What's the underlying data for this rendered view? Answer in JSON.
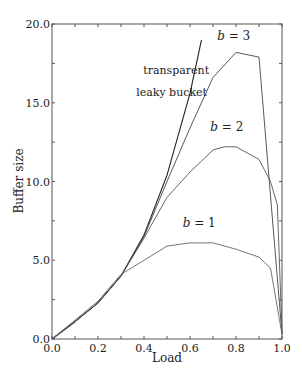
{
  "chart_data": {
    "type": "line",
    "title": "",
    "xlabel": "Load",
    "ylabel": "Buffer size",
    "xlim": [
      0.0,
      1.0
    ],
    "ylim": [
      0.0,
      20.0
    ],
    "x_ticks": [
      0.0,
      0.2,
      0.4,
      0.6,
      0.8,
      1.0
    ],
    "x_tick_labels": [
      "0.0",
      "0.2",
      "0.4",
      "0.6",
      "0.8",
      "1.0"
    ],
    "y_ticks": [
      0.0,
      5.0,
      10.0,
      15.0,
      20.0
    ],
    "y_tick_labels": [
      "0.0",
      "5.0",
      "10.0",
      "15.0",
      "20.0"
    ],
    "grid": false,
    "legend": "none",
    "series": [
      {
        "name": "transparent leaky bucket",
        "color": "#222222",
        "x": [
          0.0,
          0.1,
          0.2,
          0.3,
          0.4,
          0.5,
          0.6,
          0.65
        ],
        "y": [
          0.0,
          1.1,
          2.3,
          4.0,
          6.6,
          10.4,
          15.6,
          19.0
        ]
      },
      {
        "name": "b = 3",
        "color": "#444444",
        "x": [
          0.0,
          0.1,
          0.2,
          0.3,
          0.4,
          0.5,
          0.6,
          0.7,
          0.8,
          0.9,
          1.0
        ],
        "y": [
          0.0,
          1.1,
          2.3,
          4.0,
          6.5,
          10.0,
          13.4,
          16.6,
          18.2,
          17.9,
          0.3
        ]
      },
      {
        "name": "b = 2",
        "color": "#555555",
        "x": [
          0.0,
          0.1,
          0.2,
          0.3,
          0.4,
          0.5,
          0.6,
          0.7,
          0.75,
          0.8,
          0.9,
          0.95,
          0.98,
          1.0
        ],
        "y": [
          0.0,
          1.1,
          2.3,
          4.0,
          6.4,
          9.0,
          10.6,
          12.0,
          12.2,
          12.2,
          11.4,
          10.0,
          8.5,
          0.3
        ]
      },
      {
        "name": "b = 1",
        "color": "#666666",
        "x": [
          0.0,
          0.1,
          0.2,
          0.3,
          0.4,
          0.5,
          0.6,
          0.7,
          0.8,
          0.9,
          0.95,
          1.0
        ],
        "y": [
          0.0,
          1.2,
          2.4,
          4.1,
          5.0,
          5.9,
          6.1,
          6.1,
          5.7,
          5.2,
          4.5,
          0.3
        ]
      }
    ],
    "annotations": [
      {
        "id": "transparent",
        "text": "transparent",
        "x": 0.54,
        "y": 16.8
      },
      {
        "id": "leaky",
        "text": "leaky bucket",
        "x": 0.52,
        "y": 15.4
      },
      {
        "id": "b3",
        "text": "b = 3",
        "x": 0.79,
        "y": 19.0
      },
      {
        "id": "b2",
        "text": "b = 2",
        "x": 0.76,
        "y": 13.2
      },
      {
        "id": "b1",
        "text": "b = 1",
        "x": 0.64,
        "y": 7.1
      }
    ]
  }
}
